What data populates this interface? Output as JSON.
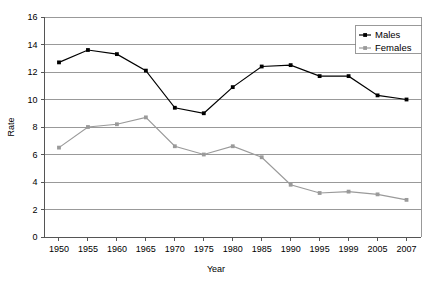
{
  "chart_data": {
    "type": "line",
    "title": "",
    "xlabel": "Year",
    "ylabel": "Rate",
    "categories": [
      "1950",
      "1955",
      "1960",
      "1965",
      "1970",
      "1975",
      "1980",
      "1985",
      "1990",
      "1995",
      "1999",
      "2005",
      "2007"
    ],
    "ylim": [
      0,
      16
    ],
    "yticks": [
      0,
      2,
      4,
      6,
      8,
      10,
      12,
      14,
      16
    ],
    "grid": true,
    "legend_position": "top-right",
    "series": [
      {
        "name": "Males",
        "color": "#000000",
        "values": [
          12.7,
          13.6,
          13.3,
          12.1,
          9.4,
          9.0,
          10.9,
          12.4,
          12.5,
          11.7,
          11.7,
          10.3,
          10.0
        ]
      },
      {
        "name": "Females",
        "color": "#9a9a9a",
        "values": [
          6.5,
          8.0,
          8.2,
          8.7,
          6.6,
          6.0,
          6.6,
          5.8,
          3.8,
          3.2,
          3.3,
          3.1,
          2.7
        ]
      }
    ]
  },
  "legend": {
    "items": [
      {
        "label": "Males"
      },
      {
        "label": "Females"
      }
    ]
  },
  "axes": {
    "y_title": "Rate",
    "x_title": "Year"
  }
}
